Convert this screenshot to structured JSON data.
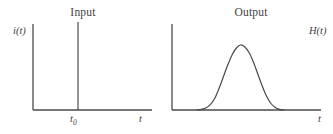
{
  "figure": {
    "width": 333,
    "height": 134,
    "background": "#ffffff",
    "line_color": "#4a4a4a",
    "text_color": "#3f3f3f"
  },
  "panels": [
    {
      "id": "input",
      "title": "Input",
      "y_axis_label": "i(t)",
      "x_axis_label": "t",
      "tick_label_base": "t",
      "tick_label_subscript": "0",
      "signal_type": "impulse"
    },
    {
      "id": "output",
      "title": "Output",
      "y_axis_label": "H(t)",
      "x_axis_label": "t",
      "signal_type": "bell-curve"
    }
  ],
  "chart_data": {
    "type": "line",
    "panels": [
      {
        "name": "Input",
        "xlabel": "t",
        "ylabel": "i(t)",
        "description": "Unit impulse (Dirac delta) located at t = t0",
        "tick_labels": [
          "t0"
        ],
        "impulse_position_t": "t0",
        "impulse_amplitude": 1.0,
        "baseline_value": 0,
        "x": [
          0,
          0.35,
          0.35,
          0.35,
          1
        ],
        "y": [
          0,
          0,
          1,
          0,
          0
        ]
      },
      {
        "name": "Output",
        "xlabel": "t",
        "ylabel": "H(t)",
        "description": "Smooth bell-shaped (Gaussian-like) impulse response",
        "tick_labels": [],
        "peak_amplitude": 1.0,
        "baseline_value": 0,
        "x": [
          0.0,
          0.05,
          0.1,
          0.15,
          0.2,
          0.25,
          0.3,
          0.35,
          0.4,
          0.45,
          0.5,
          0.55,
          0.6,
          0.65,
          0.7,
          0.75,
          0.8,
          0.85,
          0.9,
          0.95,
          1.0
        ],
        "y": [
          0.0,
          0.01,
          0.03,
          0.08,
          0.17,
          0.32,
          0.5,
          0.68,
          0.84,
          0.95,
          1.0,
          0.97,
          0.88,
          0.73,
          0.55,
          0.37,
          0.21,
          0.1,
          0.04,
          0.01,
          0.0
        ]
      }
    ],
    "grid": false,
    "legend": "none"
  }
}
